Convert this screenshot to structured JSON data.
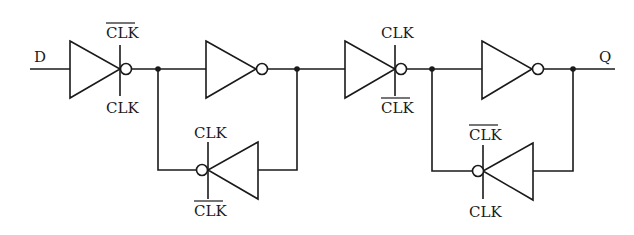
{
  "diagram": {
    "type": "circuit-schematic",
    "colors": {
      "ink": "#1a1a1a",
      "background": "#ffffff"
    },
    "signals": {
      "input": "D",
      "output": "Q"
    },
    "clock_labels": {
      "clk": "CLK",
      "clk_bar": "CLK"
    },
    "gates": [
      {
        "id": "g1",
        "kind": "clocked-inverter",
        "direction": "forward",
        "top_label": "CLK",
        "top_inverted": true,
        "bottom_label": "CLK",
        "bottom_inverted": false
      },
      {
        "id": "g2",
        "kind": "inverter",
        "direction": "forward"
      },
      {
        "id": "g3",
        "kind": "clocked-inverter",
        "direction": "feedback",
        "top_label": "CLK",
        "top_inverted": false,
        "bottom_label": "CLK",
        "bottom_inverted": true
      },
      {
        "id": "g4",
        "kind": "clocked-inverter",
        "direction": "forward",
        "top_label": "CLK",
        "top_inverted": false,
        "bottom_label": "CLK",
        "bottom_inverted": true
      },
      {
        "id": "g5",
        "kind": "inverter",
        "direction": "forward"
      },
      {
        "id": "g6",
        "kind": "clocked-inverter",
        "direction": "feedback",
        "top_label": "CLK",
        "top_inverted": true,
        "bottom_label": "CLK",
        "bottom_inverted": false
      }
    ]
  }
}
